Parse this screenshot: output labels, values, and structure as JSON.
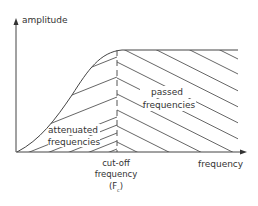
{
  "diagram": {
    "type": "high-pass filter frequency response",
    "y_axis_label": "amplitude",
    "x_axis_label": "frequency",
    "cutoff_label_lines": [
      "cut-off",
      "frequency",
      "(F  )"
    ],
    "cutoff_subscript": "c",
    "attenuated_label_lines": [
      "attenuated",
      "frequencies"
    ],
    "passed_label_lines": [
      "passed",
      "frequencies"
    ],
    "colors": {
      "line": "#444444",
      "hatch": "#555555",
      "text": "#333333",
      "background": "#ffffff"
    }
  }
}
